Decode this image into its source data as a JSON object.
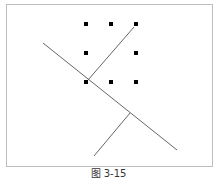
{
  "caption": "图 3-15",
  "colors": {
    "point": "#000000",
    "line": "#666666",
    "border": "#bdbdbd"
  },
  "points": [
    {
      "x": 86,
      "y": 24
    },
    {
      "x": 111,
      "y": 24
    },
    {
      "x": 136,
      "y": 24
    },
    {
      "x": 86,
      "y": 53
    },
    {
      "x": 136,
      "y": 53
    },
    {
      "x": 86,
      "y": 82
    },
    {
      "x": 111,
      "y": 82
    },
    {
      "x": 136,
      "y": 82
    }
  ],
  "lines": [
    {
      "name": "separating-line",
      "x1": 43,
      "y1": 43,
      "x2": 177,
      "y2": 150
    },
    {
      "name": "normal-vector-line",
      "x1": 88,
      "y1": 80,
      "x2": 134,
      "y2": 27
    },
    {
      "name": "perpendicular-line",
      "x1": 94,
      "y1": 156,
      "x2": 130,
      "y2": 113
    }
  ]
}
